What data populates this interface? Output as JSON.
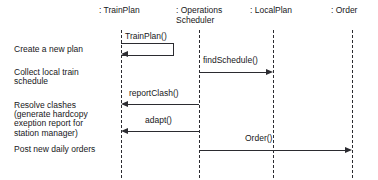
{
  "diagram": {
    "type": "uml-sequence-diagram",
    "background_color": "#ffffff",
    "line_color": "#2b2b30",
    "text_color": "#17171a"
  },
  "lifelines": [
    {
      "label": ": TrainPlan",
      "name": "trainplan",
      "x": 121
    },
    {
      "label": ": Operations\nScheduler",
      "name": "operations-scheduler",
      "x": 199
    },
    {
      "label": ": LocalPlan",
      "name": "localplan",
      "x": 273
    },
    {
      "label": ": Order",
      "name": "order",
      "x": 352
    }
  ],
  "annotations": [
    {
      "text": "Create a new plan",
      "name": "create-a-new-plan"
    },
    {
      "text": "Collect local train\nschedule",
      "name": "collect-local-train-schedule"
    },
    {
      "text": "Resolve clashes\n(generate hardcopy\nexeption report for\nstation manager)",
      "name": "resolve-clashes"
    },
    {
      "text": "Post new daily orders",
      "name": "post-new-daily-orders"
    }
  ],
  "messages": [
    {
      "label": "TrainPlan()",
      "name": "trainplan-self-call",
      "kind": "self-call",
      "from": ": TrainPlan",
      "to": ": TrainPlan",
      "direction": "self"
    },
    {
      "label": "findSchedule()",
      "name": "findschedule",
      "kind": "call",
      "from": ": Operations Scheduler",
      "to": ": LocalPlan",
      "direction": "right"
    },
    {
      "label": "reportClash()",
      "name": "reportclash",
      "kind": "call",
      "from": ": Operations Scheduler",
      "to": ": TrainPlan",
      "direction": "left"
    },
    {
      "label": "adapt()",
      "name": "adapt",
      "kind": "call",
      "from": ": Operations Scheduler",
      "to": ": TrainPlan",
      "direction": "left"
    },
    {
      "label": "Order()",
      "name": "order-message",
      "kind": "call",
      "from": ": Operations Scheduler",
      "to": ": Order",
      "direction": "right"
    }
  ]
}
